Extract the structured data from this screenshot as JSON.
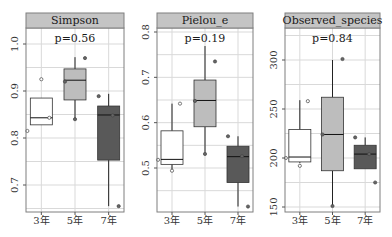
{
  "chart_data": [
    {
      "type": "box",
      "title": "Simpson",
      "annotation": "p=0.56",
      "categories": [
        "3年",
        "5年",
        "7年"
      ],
      "ylim": [
        0.643,
        1.034
      ],
      "yticks": [
        0.7,
        0.8,
        0.9,
        1.0
      ],
      "ytick_labels": [
        "0.7",
        "0.8",
        "0.9",
        "1.0"
      ],
      "boxes": [
        {
          "category": "3年",
          "whisker_low": 0.828,
          "q1": 0.828,
          "median": 0.843,
          "q3": 0.885,
          "whisker_high": 0.885,
          "points": [
            0.925,
            0.843,
            0.815
          ],
          "fill": "#ffffff"
        },
        {
          "category": "5年",
          "whisker_low": 0.84,
          "q1": 0.881,
          "median": 0.923,
          "q3": 0.947,
          "whisker_high": 0.972,
          "points": [
            0.97,
            0.92,
            0.84
          ],
          "fill": "#bdbdbd"
        },
        {
          "category": "7年",
          "whisker_low": 0.655,
          "q1": 0.753,
          "median": 0.849,
          "q3": 0.868,
          "whisker_high": 0.894,
          "points": [
            0.889,
            0.848,
            0.655
          ],
          "fill": "#595959"
        }
      ],
      "grid": true
    },
    {
      "type": "box",
      "title": "Pielou_e",
      "annotation": "p=0.19",
      "categories": [
        "3年",
        "5年",
        "7年"
      ],
      "ylim": [
        0.403,
        0.808
      ],
      "yticks": [
        0.5,
        0.6,
        0.7,
        0.8
      ],
      "ytick_labels": [
        "0.5",
        "0.6",
        "0.7",
        "0.8"
      ],
      "boxes": [
        {
          "category": "3年",
          "whisker_low": 0.492,
          "q1": 0.508,
          "median": 0.519,
          "q3": 0.582,
          "whisker_high": 0.642,
          "points": [
            0.494,
            0.642,
            0.518
          ],
          "fill": "#ffffff"
        },
        {
          "category": "5年",
          "whisker_low": 0.535,
          "q1": 0.591,
          "median": 0.649,
          "q3": 0.694,
          "whisker_high": 0.769,
          "points": [
            0.735,
            0.648,
            0.531
          ],
          "fill": "#bdbdbd"
        },
        {
          "category": "7年",
          "whisker_low": 0.415,
          "q1": 0.468,
          "median": 0.525,
          "q3": 0.548,
          "whisker_high": 0.57,
          "points": [
            0.57,
            0.526,
            0.415
          ],
          "fill": "#595959"
        }
      ],
      "grid": true
    },
    {
      "type": "box",
      "title": "Observed_species",
      "annotation": "p=0.84",
      "categories": [
        "3年",
        "5年",
        "7年"
      ],
      "ylim": [
        145,
        332.7
      ],
      "yticks": [
        150,
        200,
        250,
        300
      ],
      "ytick_labels": [
        "150",
        "200",
        "250",
        "300"
      ],
      "boxes": [
        {
          "category": "3年",
          "whisker_low": 195,
          "q1": 196,
          "median": 201,
          "q3": 229,
          "whisker_high": 259,
          "points": [
            192,
            258,
            200
          ],
          "fill": "#ffffff"
        },
        {
          "category": "5年",
          "whisker_low": 151,
          "q1": 187,
          "median": 224,
          "q3": 262,
          "whisker_high": 300,
          "points": [
            301,
            224,
            151
          ],
          "fill": "#bdbdbd"
        },
        {
          "category": "7年",
          "whisker_low": 189,
          "q1": 189,
          "median": 204,
          "q3": 213,
          "whisker_high": 221,
          "points": [
            221,
            204,
            175
          ],
          "fill": "#595959"
        }
      ],
      "grid": true
    }
  ],
  "layout": {
    "panels": [
      {
        "left": 26,
        "right": 124,
        "ytick_px": [
          185,
          138,
          92,
          44
        ]
      },
      {
        "left": 157,
        "right": 253,
        "ytick_px": [
          168,
          123,
          77,
          32
        ]
      },
      {
        "left": 285,
        "right": 380,
        "ytick_px": [
          207,
          158,
          109,
          60
        ]
      }
    ],
    "strip_top": 13,
    "strip_bottom": 28,
    "plot_bottom": 212,
    "xlabel_y": 224,
    "strip_fill": "#c4c4c4",
    "grid_color": "#d9d9d9",
    "frame_color": "#7f7f7f"
  }
}
